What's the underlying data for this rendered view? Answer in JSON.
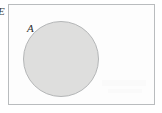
{
  "diagram": {
    "type": "venn",
    "universal_set": {
      "label": "E",
      "shape": "rectangle",
      "border_color": "#b9bcbe",
      "fill_color": "#fdfdfd"
    },
    "sets": [
      {
        "label": "A",
        "shape": "circle",
        "shaded": true,
        "fill_color": "#dededd",
        "border_color": "#b4b6b7",
        "center_x": 61,
        "center_y": 59,
        "radius": 38
      }
    ]
  }
}
